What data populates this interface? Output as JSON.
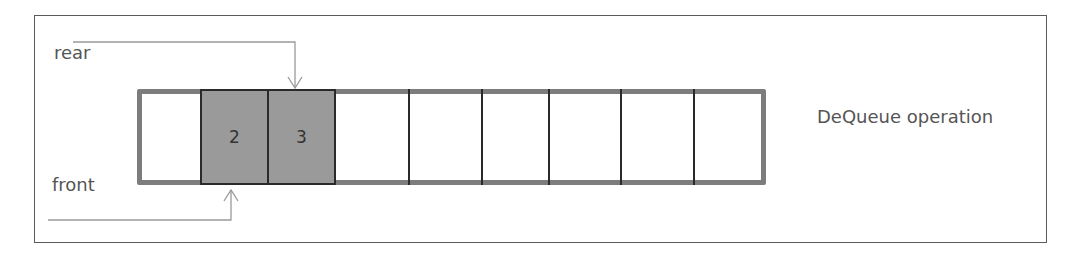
{
  "diagram": {
    "title": "DeQueue operation",
    "labels": {
      "rear": "rear",
      "front": "front"
    },
    "cells": [
      {
        "index": 0,
        "value": "",
        "state": "empty"
      },
      {
        "index": 1,
        "value": "2",
        "state": "filled"
      },
      {
        "index": 2,
        "value": "3",
        "state": "filled"
      },
      {
        "index": 3,
        "value": "",
        "state": "empty"
      },
      {
        "index": 4,
        "value": "",
        "state": "empty"
      },
      {
        "index": 5,
        "value": "",
        "state": "empty"
      },
      {
        "index": 6,
        "value": "",
        "state": "empty"
      },
      {
        "index": 7,
        "value": "",
        "state": "empty"
      },
      {
        "index": 8,
        "value": "",
        "state": "empty"
      }
    ],
    "pointers": {
      "rear_points_to_cell": 2,
      "front_points_to_cell": 1
    },
    "colors": {
      "filled_cell": "#9a9a9a",
      "array_border": "#7d7d7d",
      "arrow": "#9a9a9a",
      "text": "#555555"
    }
  }
}
